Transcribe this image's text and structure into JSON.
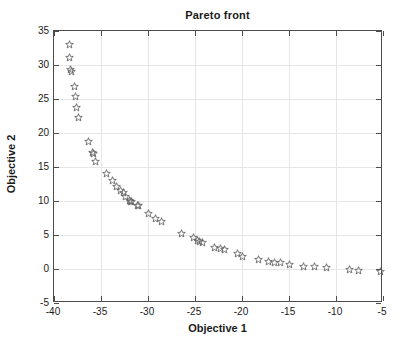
{
  "chart_data": {
    "type": "scatter",
    "title": "Pareto front",
    "xlabel": "Objective 1",
    "ylabel": "Objective 2",
    "xlim": [
      -40,
      -5
    ],
    "ylim": [
      -5,
      35
    ],
    "xticks": [
      -40,
      -35,
      -30,
      -25,
      -20,
      -15,
      -10,
      -5
    ],
    "yticks": [
      -5,
      0,
      5,
      10,
      15,
      20,
      25,
      30,
      35
    ],
    "xtick_labels": [
      "-40",
      "-35",
      "-30",
      "-25",
      "-20",
      "-15",
      "-10",
      "-5"
    ],
    "ytick_labels": [
      "-5",
      "0",
      "5",
      "10",
      "15",
      "20",
      "25",
      "30",
      "35"
    ],
    "grid": true,
    "legend": null,
    "marker": "pentagram-star-outline",
    "marker_color": "#666666",
    "series": [
      {
        "name": "Pareto front",
        "x": [
          -38.4,
          -38.3,
          -38.2,
          -38.1,
          -37.8,
          -37.7,
          -37.6,
          -37.4,
          -36.3,
          -35.9,
          -35.8,
          -35.6,
          -34.4,
          -33.8,
          -33.4,
          -32.9,
          -32.6,
          -32.4,
          -32.0,
          -31.9,
          -31.8,
          -31.1,
          -31.0,
          -30.0,
          -29.2,
          -28.6,
          -26.4,
          -25.2,
          -24.7,
          -24.5,
          -24.2,
          -22.9,
          -22.3,
          -21.9,
          -20.5,
          -19.9,
          -18.2,
          -17.2,
          -16.5,
          -15.9,
          -15.0,
          -13.5,
          -12.3,
          -11.0,
          -8.6,
          -7.6,
          -5.3
        ],
        "y": [
          33.0,
          31.1,
          29.3,
          29.0,
          26.9,
          25.3,
          23.8,
          22.3,
          18.8,
          17.2,
          17.0,
          15.8,
          14.0,
          13.0,
          12.2,
          11.5,
          11.3,
          10.6,
          10.1,
          10.0,
          9.9,
          9.4,
          9.3,
          8.1,
          7.4,
          7.0,
          5.2,
          4.7,
          4.2,
          4.0,
          3.9,
          3.2,
          3.0,
          2.8,
          2.3,
          1.9,
          1.4,
          1.1,
          1.0,
          0.95,
          0.6,
          0.35,
          0.3,
          0.15,
          -0.1,
          -0.15,
          -0.3
        ]
      }
    ]
  },
  "figure": {
    "background_color": "#ffffff",
    "axis_color": "#4d4d4d",
    "grid_color": "#e6e6e6",
    "text_color": "#1a1a1a"
  }
}
